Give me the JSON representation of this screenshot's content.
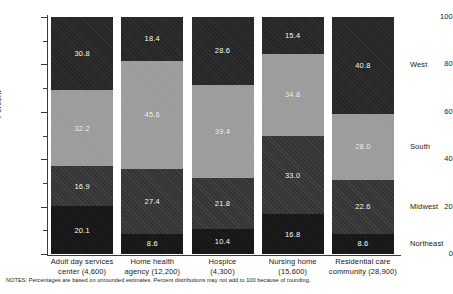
{
  "chart_data": {
    "type": "bar",
    "subtype": "stacked-bar-100",
    "title": "",
    "xlabel": "",
    "ylabel": "Percent",
    "ylim": [
      0,
      100
    ],
    "yticks": [
      0,
      20,
      40,
      60,
      80,
      100
    ],
    "ytick_labels": [
      "0",
      "20",
      "40",
      "60",
      "80",
      "100"
    ],
    "grid": false,
    "legend_position": "right",
    "categories": [
      "Adult day services center (4,600)",
      "Home health agency (12,200)",
      "Hospice (4,300)",
      "Nursing home (15,600)",
      "Residential care community (28,900)"
    ],
    "category_lines": [
      [
        "Adult day services",
        "center (4,600)"
      ],
      [
        "Home health",
        "agency (12,200)"
      ],
      [
        "Hospice",
        "(4,300)"
      ],
      [
        "Nursing home",
        "(15,600)"
      ],
      [
        "Residential care",
        "community (28,900)"
      ]
    ],
    "series": [
      {
        "name": "Northeast",
        "values": [
          20.1,
          8.6,
          10.4,
          16.8,
          8.6
        ]
      },
      {
        "name": "Midwest",
        "values": [
          16.9,
          27.4,
          21.8,
          33.0,
          22.6
        ]
      },
      {
        "name": "South",
        "values": [
          32.2,
          45.6,
          39.4,
          34.8,
          28.0
        ]
      },
      {
        "name": "West",
        "values": [
          30.8,
          18.4,
          28.6,
          15.4,
          40.8
        ]
      }
    ],
    "legend": [
      "West",
      "South",
      "Midwest",
      "Northeast"
    ],
    "colors": {
      "Northeast": "#161616",
      "Midwest": "#343434",
      "South": "#9c9c9c",
      "West": "#262626",
      "axis": "#3a3a3a",
      "text": "#1a1a1a",
      "data_label": "#ffffff"
    },
    "notes": "NOTES: Percentages are based on unrounded estimates. Percent distributions may not add to 100 because of rounding."
  }
}
